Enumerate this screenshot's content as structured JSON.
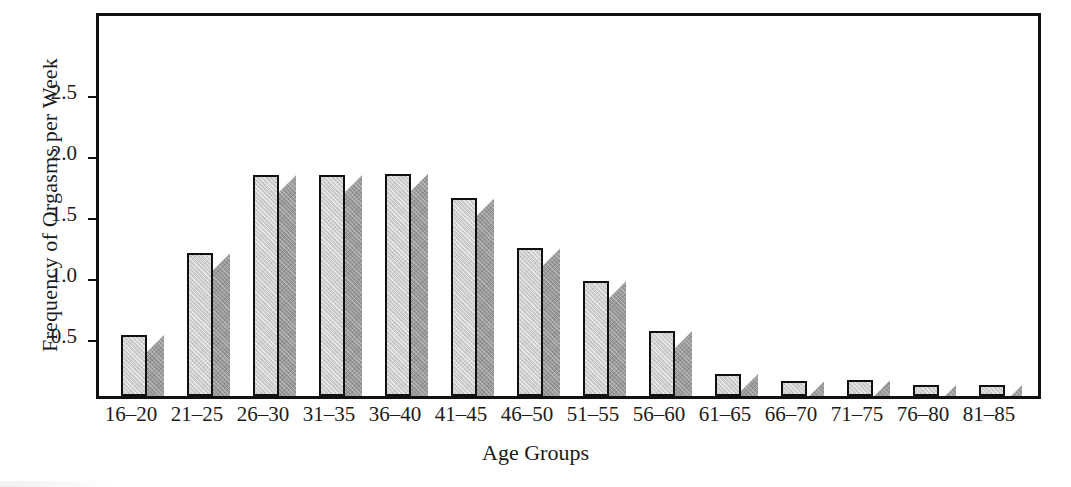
{
  "chart_data": {
    "type": "bar",
    "title": "",
    "xlabel": "Age Groups",
    "ylabel": "Frequency of Orgasms per Week",
    "categories": [
      "16–20",
      "21–25",
      "26–30",
      "31–35",
      "36–40",
      "41–45",
      "46–50",
      "51–55",
      "56–60",
      "61–65",
      "66–70",
      "71–75",
      "76–80",
      "81–85"
    ],
    "values": [
      0.5,
      1.17,
      1.81,
      1.81,
      1.82,
      1.62,
      1.21,
      0.94,
      0.53,
      0.18,
      0.12,
      0.13,
      0.09,
      0.09
    ],
    "ytick_labels": [
      "2.5",
      "2.0",
      "1.5",
      "1.0",
      "0.5"
    ],
    "ytick_values": [
      2.5,
      2.0,
      1.5,
      1.0,
      0.5
    ],
    "ylim": [
      0,
      3.08
    ],
    "xlim_categories": 14,
    "grid": false,
    "legend": null,
    "bar_style": "3d-shaded",
    "colors": {
      "bar_face": "#cfcfcf",
      "bar_side": "#9a9a9a",
      "bar_outline": "#101010",
      "axis": "#111111",
      "text": "#1b1b1b",
      "background": "#ffffff"
    }
  }
}
